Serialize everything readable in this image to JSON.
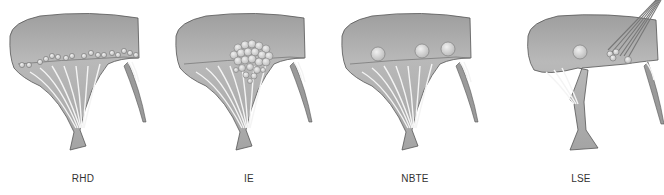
{
  "figure": {
    "panels": [
      {
        "id": "rhd",
        "label": "RHD",
        "vegetation": "small-row-beads-along-closure-line"
      },
      {
        "id": "ie",
        "label": "IE",
        "vegetation": "large-bulky-cluster-extending-to-chordae"
      },
      {
        "id": "nbte",
        "label": "NBTE",
        "vegetation": "small-bland-nodules-on-closure-line"
      },
      {
        "id": "lse",
        "label": "LSE",
        "vegetation": "nodules-on-both-surfaces"
      }
    ],
    "colors": {
      "leaflet_fill": "#a8a8a8",
      "leaflet_highlight": "#c4c4c4",
      "outline": "#555555",
      "vegetation": "#d2d2d2",
      "label": "#333333"
    }
  }
}
